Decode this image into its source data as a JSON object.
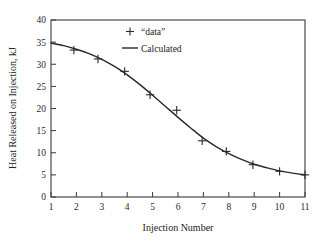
{
  "chart_data": {
    "type": "line",
    "title": "",
    "subtitle": "",
    "xlabel": "Injection Number",
    "ylabel": "Heat Released on Injection, kJ",
    "xlim": [
      1,
      11
    ],
    "ylim": [
      0,
      40
    ],
    "xticks": [
      1,
      2,
      3,
      4,
      5,
      6,
      7,
      8,
      9,
      10,
      11
    ],
    "yticks": [
      0,
      5,
      10,
      15,
      20,
      25,
      30,
      35,
      40
    ],
    "xticklabels": [
      "1",
      "2",
      "3",
      "4",
      "5",
      "6",
      "7",
      "8",
      "9",
      "10",
      "11"
    ],
    "yticklabels": [
      "0",
      "5",
      "10",
      "15",
      "20",
      "25",
      "30",
      "35",
      "40"
    ],
    "grid": false,
    "frame": "box",
    "legend_position": "upper-center",
    "series": [
      {
        "name": "“data”",
        "type": "scatter",
        "marker": "plus",
        "color": "#2a2a2a",
        "points": [
          {
            "x": 1.9,
            "y": 33.2
          },
          {
            "x": 2.85,
            "y": 31.2
          },
          {
            "x": 3.9,
            "y": 28.4
          },
          {
            "x": 4.9,
            "y": 23.1
          },
          {
            "x": 5.95,
            "y": 19.6
          },
          {
            "x": 6.95,
            "y": 12.7
          },
          {
            "x": 7.9,
            "y": 10.3
          },
          {
            "x": 8.95,
            "y": 7.3
          },
          {
            "x": 10.0,
            "y": 5.8
          },
          {
            "x": 11.0,
            "y": 5.0
          }
        ]
      },
      {
        "name": "Calculated",
        "type": "line",
        "color": "#2a2a2a",
        "points": [
          {
            "x": 1.0,
            "y": 34.8
          },
          {
            "x": 1.5,
            "y": 34.2
          },
          {
            "x": 2.0,
            "y": 33.4
          },
          {
            "x": 2.5,
            "y": 32.4
          },
          {
            "x": 3.0,
            "y": 31.1
          },
          {
            "x": 3.5,
            "y": 29.5
          },
          {
            "x": 4.0,
            "y": 27.6
          },
          {
            "x": 4.5,
            "y": 25.4
          },
          {
            "x": 5.0,
            "y": 23.0
          },
          {
            "x": 5.5,
            "y": 20.5
          },
          {
            "x": 6.0,
            "y": 18.0
          },
          {
            "x": 6.5,
            "y": 15.6
          },
          {
            "x": 7.0,
            "y": 13.3
          },
          {
            "x": 7.5,
            "y": 11.4
          },
          {
            "x": 8.0,
            "y": 9.8
          },
          {
            "x": 8.5,
            "y": 8.5
          },
          {
            "x": 9.0,
            "y": 7.4
          },
          {
            "x": 9.5,
            "y": 6.6
          },
          {
            "x": 10.0,
            "y": 5.9
          },
          {
            "x": 10.5,
            "y": 5.4
          },
          {
            "x": 11.0,
            "y": 5.0
          }
        ]
      }
    ],
    "legend": [
      {
        "label": "“data”",
        "marker": "plus"
      },
      {
        "label": "Calculated",
        "marker": "line"
      }
    ]
  }
}
